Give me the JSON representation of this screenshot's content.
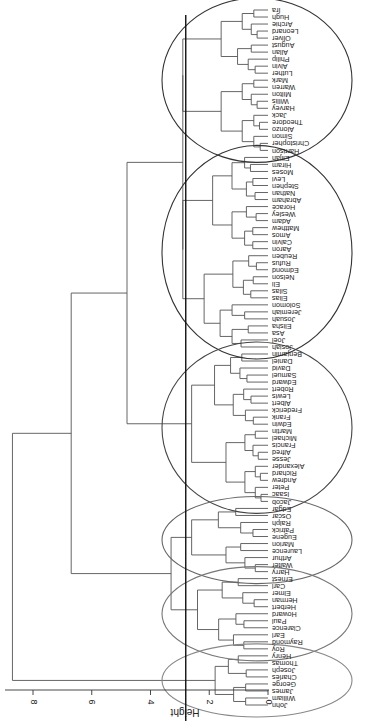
{
  "chart_data": {
    "type": "dendrogram",
    "orientation": "rotated-90 (root at left, leaves at right, text upside down)",
    "xlabel": "",
    "ylabel": "Height",
    "ylim": [
      0,
      8.8
    ],
    "y_ticks": [
      0,
      2,
      4,
      6,
      8
    ],
    "cut_height": 2.8,
    "leaves_top_to_bottom": [
      "Ira",
      "Hugh",
      "Archie",
      "Leonard",
      "Oliver",
      "August",
      "Allan",
      "Philip",
      "Alvin",
      "Luther",
      "Mark",
      "Warren",
      "Milton",
      "Willis",
      "Harvey",
      "Jack",
      "Theodore",
      "Alonzo",
      "Simon",
      "Christopher",
      "Harrison",
      "Elijah",
      "Hiram",
      "Moses",
      "Levi",
      "Stephen",
      "Nathan",
      "Abraham",
      "Horace",
      "Wesley",
      "Adam",
      "Matthew",
      "Amos",
      "Calvin",
      "Aaron",
      "Reuben",
      "Rufus",
      "Edmond",
      "Nelson",
      "Eli",
      "Silas",
      "Elias",
      "Solomon",
      "Jeremiah",
      "Josuah",
      "Elisha",
      "Asa",
      "Joel",
      "Josiah",
      "Benjamin",
      "Daniel",
      "David",
      "Samuel",
      "Edward",
      "Robert",
      "Lewis",
      "Albert",
      "Frederick",
      "Frank",
      "Edwin",
      "Martin",
      "Michael",
      "Francis",
      "Alfred",
      "Jesse",
      "Alexander",
      "Richard",
      "Andrew",
      "Peter",
      "Isaac",
      "Jacob",
      "Edgar",
      "Oscar",
      "Ralph",
      "Patrick",
      "Eugene",
      "Marion",
      "Laurence",
      "Arthur",
      "Walter",
      "Harry",
      "Ernest",
      "Carl",
      "Elmer",
      "Herman",
      "Herbert",
      "Howard",
      "Paul",
      "Clarence",
      "Earl",
      "Raymond",
      "Roy",
      "Henry",
      "Thomas",
      "Joseph",
      "Charles",
      "George",
      "James",
      "William",
      "John"
    ],
    "clusters": [
      {
        "id": 1,
        "first": "Ira",
        "last": "Harrison",
        "merge_height": 2.9,
        "ellipse_color": "#333333"
      },
      {
        "id": 2,
        "first": "Elijah",
        "last": "Josiah",
        "merge_height": 2.9,
        "ellipse_color": "#333333"
      },
      {
        "id": 3,
        "first": "Benjamin",
        "last": "Jacob",
        "merge_height": 2.6,
        "ellipse_color": "#444444"
      },
      {
        "id": 4,
        "first": "Edgar",
        "last": "Harry",
        "merge_height": 2.6,
        "ellipse_color": "#666666"
      },
      {
        "id": 5,
        "first": "Ernest",
        "last": "Roy",
        "merge_height": 2.4,
        "ellipse_color": "#777777"
      },
      {
        "id": 6,
        "first": "Henry",
        "last": "John",
        "merge_height": 1.8,
        "ellipse_color": "#888888"
      }
    ],
    "merges": [
      {
        "children": [
          "cluster1",
          "cluster2"
        ],
        "height": 2.9
      },
      {
        "children": [
          "cluster1+2",
          "cluster3"
        ],
        "height": 4.8
      },
      {
        "children": [
          "cluster4",
          "cluster5"
        ],
        "height": 3.3
      },
      {
        "children": [
          "cluster1-3",
          "cluster4+5"
        ],
        "height": 6.7
      },
      {
        "children": [
          "cluster1-5",
          "cluster6"
        ],
        "height": 8.7
      }
    ]
  },
  "axis": {
    "label": "Height",
    "ticks": [
      "0",
      "2",
      "4",
      "6",
      "8"
    ]
  },
  "colors": {
    "line": "#555555",
    "cut_line": "#111111",
    "text": "#222222"
  }
}
